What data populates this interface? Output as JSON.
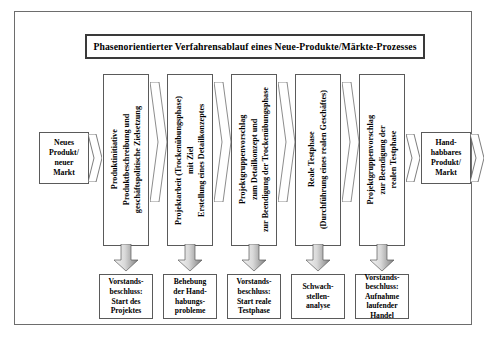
{
  "title": {
    "text": "Phasenorientierter Verfahrensablauf eines Neue-Produkte/Märkte-Prozesses"
  },
  "terminals": {
    "start": {
      "label": "Neues\nProdukt/\nneuer\nMarkt",
      "name": "neues-produkt-neuer-markt"
    },
    "end": {
      "label": "Hand-\nhabbares\nProdukt/\nMarkt",
      "name": "handhabbares-produkt-markt"
    }
  },
  "phases": [
    {
      "id": 1,
      "label": "Produktinitiative\nProduktbeschreibung und\ngeschäftspolitische Zielsetzung"
    },
    {
      "id": 2,
      "label": "Projektarbeit (Trockenübungsphase)\nmit Ziel\nErstellung eines Detailkonzeptes"
    },
    {
      "id": 3,
      "label": "Projektgruppenvorschlag\nzum Detailkonzept und\nzur Beendigung der Trockenübungsphase"
    },
    {
      "id": 4,
      "label": "Reale Testphase\n(Durchführung eines realen Geschäftes)"
    },
    {
      "id": 5,
      "label": "Projektgruppenvorschlag\nzur Beendigung der\nrealen Testphase"
    }
  ],
  "results": [
    {
      "id": 1,
      "label": "Vorstands-\nbeschluss:\nStart des\nProjektes"
    },
    {
      "id": 2,
      "label": "Behebung\nder Hand-\nhabungs-\nprobleme"
    },
    {
      "id": 3,
      "label": "Vorstands-\nbeschluss:\nStart reale\nTestphase"
    },
    {
      "id": 4,
      "label": "Schwach-\nstellen-\nanalyse"
    },
    {
      "id": 5,
      "label": "Vorstands-\nbeschluss:\nAufnahme\nlaufender\nHandel"
    }
  ],
  "colors": {
    "frame_border": "#6d6d6d",
    "box_border": "#5a5a5a",
    "title_border": "#3a3a3a",
    "arrow_fill_light": "#f2f2f2",
    "arrow_fill_dark": "#8a8a8a",
    "arrow_stroke": "#5a5a5a",
    "background": "#ffffff",
    "text": "#000000"
  }
}
